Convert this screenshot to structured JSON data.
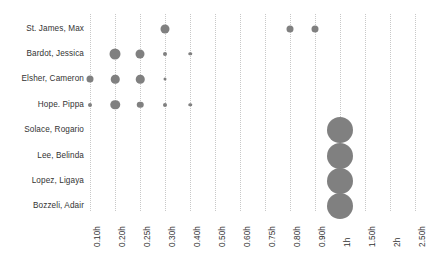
{
  "chart_data": {
    "type": "scatter",
    "title": "",
    "subtitle": "",
    "xlabel": "",
    "ylabel": "",
    "grid": true,
    "legend": "none",
    "bubble_color": "#808080",
    "gridline_color": "#c8c8c8",
    "text_color": "#333333",
    "categories": [
      "St. James, Max",
      "Bardot, Jessica",
      "Elsher, Cameron",
      "Hope. Pippa",
      "Solace, Rogario",
      "Lee, Belinda",
      "Lopez, Ligaya",
      "Bozzeli, Adair"
    ],
    "x_tick_labels": [
      "0.10h",
      "0.20h",
      "0.25h",
      "0.30h",
      "0.40h",
      "0.50h",
      "0.60h",
      "0.75h",
      "0.80h",
      "0.90h",
      "1h",
      "1.50h",
      "2h",
      "2.50h"
    ],
    "points": [
      {
        "row": "St. James, Max",
        "x": "0.30h",
        "size": 9
      },
      {
        "row": "St. James, Max",
        "x": "0.80h",
        "size": 7
      },
      {
        "row": "St. James, Max",
        "x": "0.90h",
        "size": 7
      },
      {
        "row": "Bardot, Jessica",
        "x": "0.20h",
        "size": 11
      },
      {
        "row": "Bardot, Jessica",
        "x": "0.25h",
        "size": 9
      },
      {
        "row": "Bardot, Jessica",
        "x": "0.30h",
        "size": 4
      },
      {
        "row": "Bardot, Jessica",
        "x": "0.40h",
        "size": 3.5
      },
      {
        "row": "Elsher, Cameron",
        "x": "0.10h",
        "size": 7
      },
      {
        "row": "Elsher, Cameron",
        "x": "0.20h",
        "size": 8.5
      },
      {
        "row": "Elsher, Cameron",
        "x": "0.25h",
        "size": 8.5
      },
      {
        "row": "Elsher, Cameron",
        "x": "0.30h",
        "size": 3
      },
      {
        "row": "Hope. Pippa",
        "x": "0.10h",
        "size": 4
      },
      {
        "row": "Hope. Pippa",
        "x": "0.20h",
        "size": 9.5
      },
      {
        "row": "Hope. Pippa",
        "x": "0.25h",
        "size": 6.5
      },
      {
        "row": "Hope. Pippa",
        "x": "0.30h",
        "size": 4
      },
      {
        "row": "Hope. Pippa",
        "x": "0.40h",
        "size": 3.5
      },
      {
        "row": "Solace, Rogario",
        "x": "1h",
        "size": 26
      },
      {
        "row": "Lee, Belinda",
        "x": "1h",
        "size": 26
      },
      {
        "row": "Lopez, Ligaya",
        "x": "1h",
        "size": 26
      },
      {
        "row": "Bozzeli, Adair",
        "x": "1h",
        "size": 26
      }
    ]
  }
}
